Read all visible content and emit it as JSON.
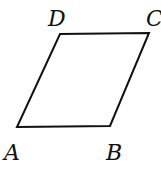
{
  "figure": {
    "type": "parallelogram",
    "stroke_color": "#111111",
    "background": "#ffffff",
    "vertices": [
      {
        "name": "A",
        "x": 17,
        "y": 127,
        "label_x": 4,
        "label_y": 160
      },
      {
        "name": "B",
        "x": 110,
        "y": 126,
        "label_x": 106,
        "label_y": 160
      },
      {
        "name": "C",
        "x": 149,
        "y": 33,
        "label_x": 146,
        "label_y": 26
      },
      {
        "name": "D",
        "x": 60,
        "y": 34,
        "label_x": 48,
        "label_y": 26
      }
    ],
    "edges": [
      [
        "A",
        "B"
      ],
      [
        "B",
        "C"
      ],
      [
        "C",
        "D"
      ],
      [
        "D",
        "A"
      ]
    ]
  },
  "labels": {
    "A": "A",
    "B": "B",
    "C": "C",
    "D": "D"
  }
}
